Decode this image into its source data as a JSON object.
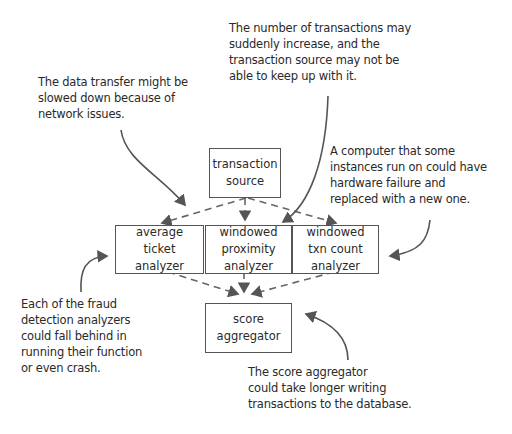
{
  "diagram": {
    "nodes": {
      "transaction_source": {
        "lines": [
          "transaction",
          "source"
        ]
      },
      "average_ticket_analyzer": {
        "lines": [
          "average",
          "ticket",
          "analyzer"
        ]
      },
      "windowed_proximity_analyzer": {
        "lines": [
          "windowed",
          "proximity",
          "analyzer"
        ]
      },
      "windowed_txn_count_analyzer": {
        "lines": [
          "windowed",
          "txn count",
          "analyzer"
        ]
      },
      "score_aggregator": {
        "lines": [
          "score",
          "aggregator"
        ]
      }
    },
    "annotations": {
      "network": {
        "lines": [
          "The data transfer might be",
          "slowed down because of",
          "network issues."
        ]
      },
      "source_load": {
        "lines": [
          "The number of transactions may",
          "suddenly increase, and the",
          "transaction source may not be",
          "able to keep up with it."
        ]
      },
      "hardware": {
        "lines": [
          "A computer that some",
          "instances run on could have",
          "hardware failure and",
          "replaced with a new one."
        ]
      },
      "analyzers": {
        "lines": [
          "Each of the fraud",
          "detection analyzers",
          "could fall behind in",
          "running their function",
          "or even crash."
        ]
      },
      "aggregator": {
        "lines": [
          "The score aggregator",
          "could take longer writing",
          "transactions to the database."
        ]
      }
    },
    "edges": [
      {
        "from": "transaction_source",
        "to": "average_ticket_analyzer",
        "style": "dashed"
      },
      {
        "from": "transaction_source",
        "to": "windowed_proximity_analyzer",
        "style": "dashed"
      },
      {
        "from": "transaction_source",
        "to": "windowed_txn_count_analyzer",
        "style": "dashed"
      },
      {
        "from": "average_ticket_analyzer",
        "to": "score_aggregator",
        "style": "dashed"
      },
      {
        "from": "windowed_proximity_analyzer",
        "to": "score_aggregator",
        "style": "dashed"
      },
      {
        "from": "windowed_txn_count_analyzer",
        "to": "score_aggregator",
        "style": "dashed"
      }
    ],
    "colors": {
      "line": "#555555",
      "text": "#2a2a2a",
      "background": "#ffffff"
    }
  }
}
